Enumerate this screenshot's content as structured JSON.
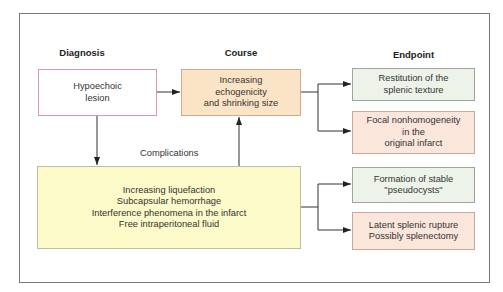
{
  "headers": {
    "diagnosis": "Diagnosis",
    "course": "Course",
    "endpoint": "Endpoint"
  },
  "nodes": {
    "diagnosis": "Hypoechoic\nlesion",
    "course": "Increasing\nechogenicity\nand shrinking size",
    "complications": "Increasing liquefaction\nSubcapsular  hemorrhage\nInterference phenomena in the infarct\nFree intraperitoneal fluid",
    "endpoint_1": "Restitution of the\nsplenic texture",
    "endpoint_2": "Focal nonhomogeneity\nin the\noriginal infarct",
    "endpoint_3": "Formation of stable\n\"pseudocysts\"",
    "endpoint_4": "Latent splenic rupture\nPossibly splenectomy"
  },
  "edge_labels": {
    "complications": "Complications"
  },
  "colors": {
    "diagnosis_border": "#d99aa2",
    "course_fill": "#fbe3c6",
    "good_endpoint_fill": "#eef3ea",
    "bad_endpoint_fill": "#fbe6dc",
    "complications_fill": "#fdfac9"
  }
}
